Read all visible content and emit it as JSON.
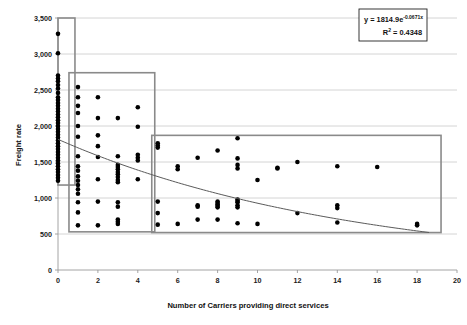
{
  "chart_data": {
    "type": "scatter",
    "title": "",
    "xlabel": "Number of Carriers providing direct services",
    "ylabel": "Freight rate",
    "xlim": [
      0,
      20
    ],
    "ylim": [
      0,
      3500
    ],
    "xticks": [
      "0",
      "2",
      "4",
      "6",
      "8",
      "10",
      "12",
      "14",
      "16",
      "18",
      "20"
    ],
    "yticks": [
      "0",
      "500",
      "1,000",
      "1,500",
      "2,000",
      "2,500",
      "3,000",
      "3,500"
    ],
    "grid": true,
    "legend": "none",
    "annotations": {
      "equation_line1_prefix": "y = 1814.9e",
      "equation_line1_exponent": "-0.0671x",
      "equation_line2_prefix": "R",
      "equation_line2_sup": "2",
      "equation_line2_value": " = 0.4348"
    },
    "trendline": {
      "kind": "exponential",
      "a": 1814.9,
      "b": -0.0671,
      "r_squared": 0.4348,
      "x_start": 0,
      "x_end": 18.6
    },
    "group_boxes": [
      {
        "name": "cluster-1",
        "x0": 0.0,
        "x1": 0.85,
        "y0": 1180,
        "y1": 3500
      },
      {
        "name": "cluster-2",
        "x0": 0.55,
        "x1": 4.85,
        "y0": 530,
        "y1": 2740
      },
      {
        "name": "cluster-3",
        "x0": 4.7,
        "x1": 19.2,
        "y0": 520,
        "y1": 1870
      }
    ],
    "points": [
      [
        0,
        3280
      ],
      [
        0,
        3010
      ],
      [
        0,
        2700
      ],
      [
        0,
        2660
      ],
      [
        0,
        2620
      ],
      [
        0,
        2570
      ],
      [
        0,
        2520
      ],
      [
        0,
        2460
      ],
      [
        0,
        2400
      ],
      [
        0,
        2360
      ],
      [
        0,
        2320
      ],
      [
        0,
        2280
      ],
      [
        0,
        2240
      ],
      [
        0,
        2200
      ],
      [
        0,
        2160
      ],
      [
        0,
        2120
      ],
      [
        0,
        2080
      ],
      [
        0,
        2040
      ],
      [
        0,
        2000
      ],
      [
        0,
        1960
      ],
      [
        0,
        1920
      ],
      [
        0,
        1880
      ],
      [
        0,
        1840
      ],
      [
        0,
        1800
      ],
      [
        0,
        1760
      ],
      [
        0,
        1720
      ],
      [
        0,
        1680
      ],
      [
        0,
        1640
      ],
      [
        0,
        1600
      ],
      [
        0,
        1560
      ],
      [
        0,
        1520
      ],
      [
        0,
        1480
      ],
      [
        0,
        1440
      ],
      [
        0,
        1400
      ],
      [
        0,
        1360
      ],
      [
        0,
        1320
      ],
      [
        0,
        1280
      ],
      [
        0,
        1240
      ],
      [
        1,
        2540
      ],
      [
        1,
        2400
      ],
      [
        1,
        2280
      ],
      [
        1,
        2180
      ],
      [
        1,
        2000
      ],
      [
        1,
        1850
      ],
      [
        1,
        1580
      ],
      [
        1,
        1440
      ],
      [
        1,
        1380
      ],
      [
        1,
        1300
      ],
      [
        1,
        1240
      ],
      [
        1,
        1180
      ],
      [
        1,
        1120
      ],
      [
        1,
        1060
      ],
      [
        1,
        940
      ],
      [
        1,
        800
      ],
      [
        1,
        620
      ],
      [
        2,
        2400
      ],
      [
        2,
        2110
      ],
      [
        2,
        1870
      ],
      [
        2,
        1720
      ],
      [
        2,
        1570
      ],
      [
        2,
        1260
      ],
      [
        2,
        950
      ],
      [
        2,
        620
      ],
      [
        3,
        2110
      ],
      [
        3,
        1580
      ],
      [
        3,
        1460
      ],
      [
        3,
        1430
      ],
      [
        3,
        1400
      ],
      [
        3,
        1360
      ],
      [
        3,
        1330
      ],
      [
        3,
        1290
      ],
      [
        3,
        1250
      ],
      [
        3,
        1220
      ],
      [
        3,
        940
      ],
      [
        3,
        880
      ],
      [
        3,
        700
      ],
      [
        3,
        670
      ],
      [
        3,
        640
      ],
      [
        4,
        2260
      ],
      [
        4,
        1990
      ],
      [
        4,
        1600
      ],
      [
        4,
        1560
      ],
      [
        4,
        1520
      ],
      [
        4,
        1260
      ],
      [
        5,
        1760
      ],
      [
        5,
        1730
      ],
      [
        5,
        1700
      ],
      [
        5,
        950
      ],
      [
        5,
        790
      ],
      [
        5,
        630
      ],
      [
        6,
        1440
      ],
      [
        6,
        1400
      ],
      [
        6,
        640
      ],
      [
        7,
        1560
      ],
      [
        7,
        900
      ],
      [
        7,
        880
      ],
      [
        7,
        700
      ],
      [
        8,
        1660
      ],
      [
        8,
        950
      ],
      [
        8,
        930
      ],
      [
        8,
        910
      ],
      [
        8,
        890
      ],
      [
        8,
        870
      ],
      [
        8,
        700
      ],
      [
        9,
        1460
      ],
      [
        9,
        1830
      ],
      [
        9,
        1550
      ],
      [
        9,
        1410
      ],
      [
        9,
        980
      ],
      [
        9,
        960
      ],
      [
        9,
        940
      ],
      [
        9,
        900
      ],
      [
        9,
        870
      ],
      [
        9,
        650
      ],
      [
        10,
        1250
      ],
      [
        10,
        640
      ],
      [
        11,
        1410
      ],
      [
        11,
        1420
      ],
      [
        12,
        1500
      ],
      [
        12,
        790
      ],
      [
        14,
        1440
      ],
      [
        14,
        900
      ],
      [
        14,
        860
      ],
      [
        14,
        660
      ],
      [
        16,
        1430
      ],
      [
        18,
        640
      ],
      [
        18,
        620
      ]
    ]
  }
}
